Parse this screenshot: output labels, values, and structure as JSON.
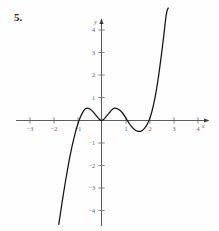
{
  "figure": {
    "problem_number": "5.",
    "axis_labels": {
      "x": "x",
      "y": "y"
    },
    "x_ticks": [
      {
        "value": -3,
        "label": "−3"
      },
      {
        "value": -2,
        "label": "−2"
      },
      {
        "value": -1,
        "label": "−1"
      },
      {
        "value": 1,
        "label": "1"
      },
      {
        "value": 2,
        "label": "2"
      },
      {
        "value": 3,
        "label": "3"
      },
      {
        "value": 4,
        "label": "4"
      }
    ],
    "y_ticks": [
      {
        "value": 4,
        "label": "4"
      },
      {
        "value": 3,
        "label": "3"
      },
      {
        "value": 2,
        "label": "2"
      },
      {
        "value": 1,
        "label": "1"
      },
      {
        "value": -1,
        "label": "−1"
      },
      {
        "value": -2,
        "label": "−2"
      },
      {
        "value": -3,
        "label": "−3"
      },
      {
        "value": -4,
        "label": "−4"
      }
    ],
    "colors": {
      "curve": "#141414",
      "axis": "#4a4a4a",
      "tick_text": "#5a5a5a",
      "background": "#fefefe"
    }
  },
  "chart_data": {
    "type": "line",
    "title": "",
    "xlabel": "x",
    "ylabel": "y",
    "xlim": [
      -3.6,
      4.6
    ],
    "ylim": [
      -4.9,
      5.0
    ],
    "grid": false,
    "legend": null,
    "xticks": [
      -3,
      -2,
      -1,
      1,
      2,
      3,
      4
    ],
    "yticks": [
      4,
      3,
      2,
      1,
      -1,
      -2,
      -3,
      -4
    ],
    "series": [
      {
        "name": "curve",
        "x": [
          -1.78,
          -1.7,
          -1.6,
          -1.5,
          -1.4,
          -1.3,
          -1.2,
          -1.1,
          -1.0,
          -0.9,
          -0.8,
          -0.7,
          -0.65,
          -0.6,
          -0.5,
          -0.4,
          -0.3,
          -0.2,
          -0.1,
          0.0,
          0.1,
          0.2,
          0.3,
          0.4,
          0.5,
          0.55,
          0.6,
          0.7,
          0.8,
          0.9,
          1.0,
          1.1,
          1.2,
          1.3,
          1.4,
          1.5,
          1.6,
          1.7,
          1.8,
          1.9,
          2.0,
          2.1,
          2.2,
          2.3,
          2.4,
          2.5,
          2.6,
          2.7,
          2.78
        ],
        "y": [
          -4.62,
          -4.05,
          -3.35,
          -2.7,
          -2.08,
          -1.52,
          -1.02,
          -0.58,
          -0.2,
          0.1,
          0.33,
          0.49,
          0.53,
          0.55,
          0.52,
          0.44,
          0.32,
          0.19,
          0.07,
          0.0,
          0.06,
          0.18,
          0.31,
          0.44,
          0.53,
          0.55,
          0.54,
          0.5,
          0.42,
          0.3,
          0.14,
          -0.04,
          -0.2,
          -0.33,
          -0.42,
          -0.47,
          -0.48,
          -0.44,
          -0.34,
          -0.18,
          0.06,
          0.4,
          0.86,
          1.44,
          2.14,
          2.95,
          3.82,
          4.72,
          5.0
        ]
      }
    ],
    "annotations": [
      {
        "text": "5.",
        "kind": "problem-label",
        "position": "top-left"
      }
    ],
    "features": {
      "local_maxima": [
        {
          "x": -0.63,
          "y": 0.55
        },
        {
          "x": 0.55,
          "y": 0.55
        }
      ],
      "local_minima": [
        {
          "x": 0.0,
          "y": 0.0
        },
        {
          "x": 1.57,
          "y": -0.48
        }
      ],
      "x_intercepts": [
        -1.03,
        0.0,
        1.07,
        1.98
      ],
      "end_behavior": {
        "left": "falls steeply below y=-4.6",
        "right": "rises steeply above y=5"
      }
    }
  }
}
